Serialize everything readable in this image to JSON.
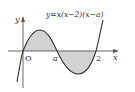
{
  "figure": {
    "equation": "y=x(x−2)(x−a)",
    "axis_labels": {
      "x": "x",
      "y": "y"
    },
    "origin_label": "O",
    "tick_labels": {
      "a": "a",
      "two": "2"
    },
    "colors": {
      "curve": "#333333",
      "axis": "#444444",
      "shading": "#cfcfcf"
    }
  }
}
